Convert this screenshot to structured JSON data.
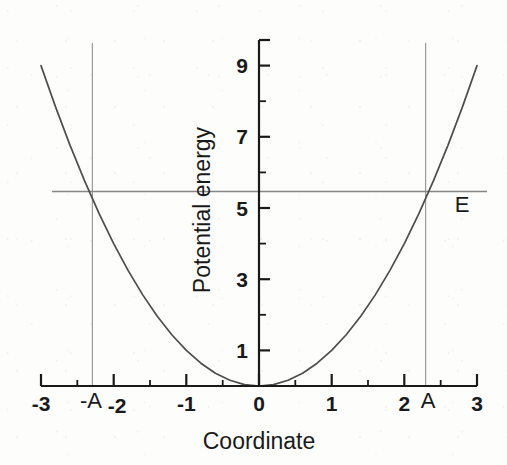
{
  "chart_data": {
    "type": "line",
    "title": "",
    "xlabel": "Coordinate",
    "ylabel": "Potential energy",
    "xlim": [
      -3,
      3
    ],
    "ylim": [
      0,
      9.7
    ],
    "grid": false,
    "legend": "none",
    "x_ticks": [
      -3,
      -2,
      -1,
      0,
      1,
      2,
      3
    ],
    "x_tick_labels": [
      "-3",
      "-2",
      "-1",
      "0",
      "1",
      "2",
      "3"
    ],
    "x_minor_ticks": [
      -2.5,
      -1.5,
      -0.5,
      0.5,
      1.5,
      2.5
    ],
    "y_ticks": [
      1,
      3,
      5,
      7,
      9
    ],
    "y_tick_labels": [
      "1",
      "3",
      "5",
      "7",
      "9"
    ],
    "y_minor_ticks": [
      2,
      4,
      6,
      8
    ],
    "series": [
      {
        "name": "Potential energy U(x) = x^2",
        "type": "line",
        "x": [
          -3,
          -2.8,
          -2.6,
          -2.4,
          -2.2,
          -2,
          -1.8,
          -1.6,
          -1.4,
          -1.2,
          -1,
          -0.8,
          -0.6,
          -0.4,
          -0.2,
          0,
          0.2,
          0.4,
          0.6,
          0.8,
          1,
          1.2,
          1.4,
          1.6,
          1.8,
          2,
          2.2,
          2.4,
          2.6,
          2.8,
          3
        ],
        "y": [
          9,
          7.84,
          6.76,
          5.76,
          4.84,
          4,
          3.24,
          2.56,
          1.96,
          1.44,
          1,
          0.64,
          0.36,
          0.16,
          0.04,
          0,
          0.04,
          0.16,
          0.36,
          0.64,
          1,
          1.44,
          1.96,
          2.56,
          3.24,
          4,
          4.84,
          5.76,
          6.76,
          7.84,
          9
        ]
      },
      {
        "name": "Total energy E",
        "type": "hline",
        "value": 5.4
      }
    ],
    "annotations": [
      {
        "name": "energy-level-label",
        "text": "E",
        "x": 2.98,
        "y": 5.05
      },
      {
        "name": "negative-amplitude-label",
        "text": "-A",
        "x": -2.32,
        "y": -0.62
      },
      {
        "name": "positive-amplitude-label",
        "text": "A",
        "x": 2.32,
        "y": -0.62
      }
    ],
    "turning_points": {
      "amplitude_value": 2.324,
      "negative_label": "-A",
      "positive_label": "A",
      "energy_value": 5.4
    }
  },
  "axes": {
    "x_title": "Coordinate",
    "y_title": "Potential energy"
  },
  "colors": {
    "curve": "#4d4d4d",
    "energy_line": "#878787",
    "marker_line": "#9a9a9a",
    "axis": "#1a1a1a",
    "text": "#1a1a1a",
    "background": "#fdfdfb"
  }
}
